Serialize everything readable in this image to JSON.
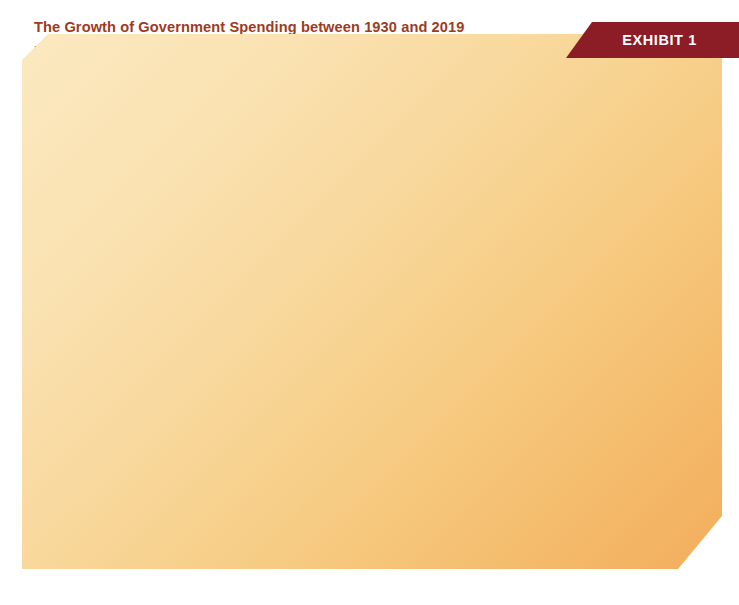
{
  "exhibit": {
    "label": "EXHIBIT 1",
    "banner_color": "#8c1c26"
  },
  "card": {
    "title": "The Growth of Government Spending between 1930 and 2019",
    "title_color": "#a03a1e",
    "description_left": "U.S. government expenditures as a share of the economy's gross domestic product have risen",
    "description_right": "dramatically since 1930. In 2019, the ratio was 36 percent, up from 32 percent in 2000."
  },
  "source_note": "Source: Bureau of Economic Analysis, http://www.bea.gov. Grants to state and local governments are included in federal expenditures. Individual data may not add to total due to rounding.",
  "legend": {
    "items": [
      {
        "label": "Federal",
        "color": "#1d5840"
      },
      {
        "label": "State and local",
        "color": "#f6b35f"
      }
    ]
  },
  "chart_data": {
    "type": "bar",
    "orientation": "horizontal",
    "stacked": true,
    "title": "The Growth of Government Spending between 1930 and 2019",
    "xlabel": "Percentage of GDP",
    "ylabel": "",
    "xlim": [
      0,
      45
    ],
    "xticks": [
      0,
      5,
      10,
      15,
      20,
      25,
      30,
      35,
      40,
      45
    ],
    "xtick_labels": [
      "0",
      "5",
      "10",
      "15",
      "20",
      "25",
      "30",
      "35",
      "40",
      "45"
    ],
    "grid": false,
    "legend_position": "top-right-inside",
    "categories": [
      "1930",
      "1940",
      "1950",
      "1960",
      "1970",
      "1980",
      "1990",
      "2000",
      "2010",
      "2019"
    ],
    "series": [
      {
        "name": "Federal",
        "color": "#1d5840",
        "values": [
          3.3,
          8.9,
          15.6,
          17.2,
          20.5,
          21.8,
          21.6,
          18.7,
          25.1,
          22.4
        ],
        "labels": [
          "3.3",
          "8.9",
          "15.6",
          "17.2",
          "20.5",
          "21.8",
          "21.6",
          "18.7",
          "25.1",
          "22.4"
        ]
      },
      {
        "name": "State and local",
        "color": "#f6b35f",
        "values": [
          6.6,
          7.6,
          6.5,
          7.7,
          11.0,
          12.0,
          12.9,
          13.1,
          15.4,
          13.8
        ],
        "labels": [
          "6.6",
          "7.6",
          "6.5",
          "7.7",
          "11.0",
          "12.0",
          "12.9",
          "13.1",
          "15.4",
          "13.8"
        ]
      }
    ],
    "totals": [
      9.9,
      16.5,
      22.2,
      24.9,
      31.5,
      33.7,
      34.5,
      31.8,
      40.5,
      36.2
    ],
    "total_labels": [
      "9.9",
      "16.5",
      "22.2",
      "24.9",
      "31.5",
      "33.7",
      "34.5",
      "31.8",
      "40.5",
      "36.2"
    ]
  }
}
